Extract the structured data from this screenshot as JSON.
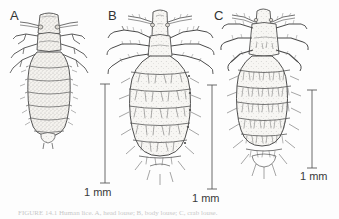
{
  "figure": {
    "type": "scientific-illustration-plate",
    "background_color": "#fdfdfd",
    "ink_color": "#3a3a3a",
    "panels": [
      {
        "id": "A",
        "label": "A",
        "description": "Head louse (Pediculus humanus capitis) - elongate stippled body, sparse setae, rectangular head",
        "label_x": 10,
        "label_y": 8,
        "body_style": "stippled",
        "abdomen_segments": 7
      },
      {
        "id": "B",
        "label": "B",
        "description": "Body louse (Pediculus humanus humanus) - broad rounded hairy abdomen, long narrow head",
        "label_x": 108,
        "label_y": 8,
        "body_style": "hairy-broad",
        "abdomen_segments": 7
      },
      {
        "id": "C",
        "label": "C",
        "description": "Crab / pubic louse (Pthirus pubis) - narrow hairy abdomen with dense setal bands",
        "label_x": 214,
        "label_y": 8,
        "body_style": "hairy-narrow",
        "abdomen_segments": 6
      }
    ],
    "scale_bars": [
      {
        "for_panel": "A",
        "label": "1 mm",
        "x": 105,
        "y_top": 84,
        "y_bottom": 183,
        "label_x": 84,
        "label_y": 186
      },
      {
        "for_panel": "B",
        "label": "1 mm",
        "x": 212,
        "y_top": 85,
        "y_bottom": 189,
        "label_x": 192,
        "label_y": 192
      },
      {
        "for_panel": "C",
        "label": "1 mm",
        "x": 312,
        "y_top": 90,
        "y_bottom": 168,
        "label_x": 300,
        "label_y": 170
      }
    ],
    "caption": {
      "prefix": "FIGURE",
      "text": "FIGURE   14.1   Human   lice.   A,   head   louse;   B,   body   louse;   C,   crab   louse.",
      "visible": "partially cropped at bottom edge"
    }
  }
}
